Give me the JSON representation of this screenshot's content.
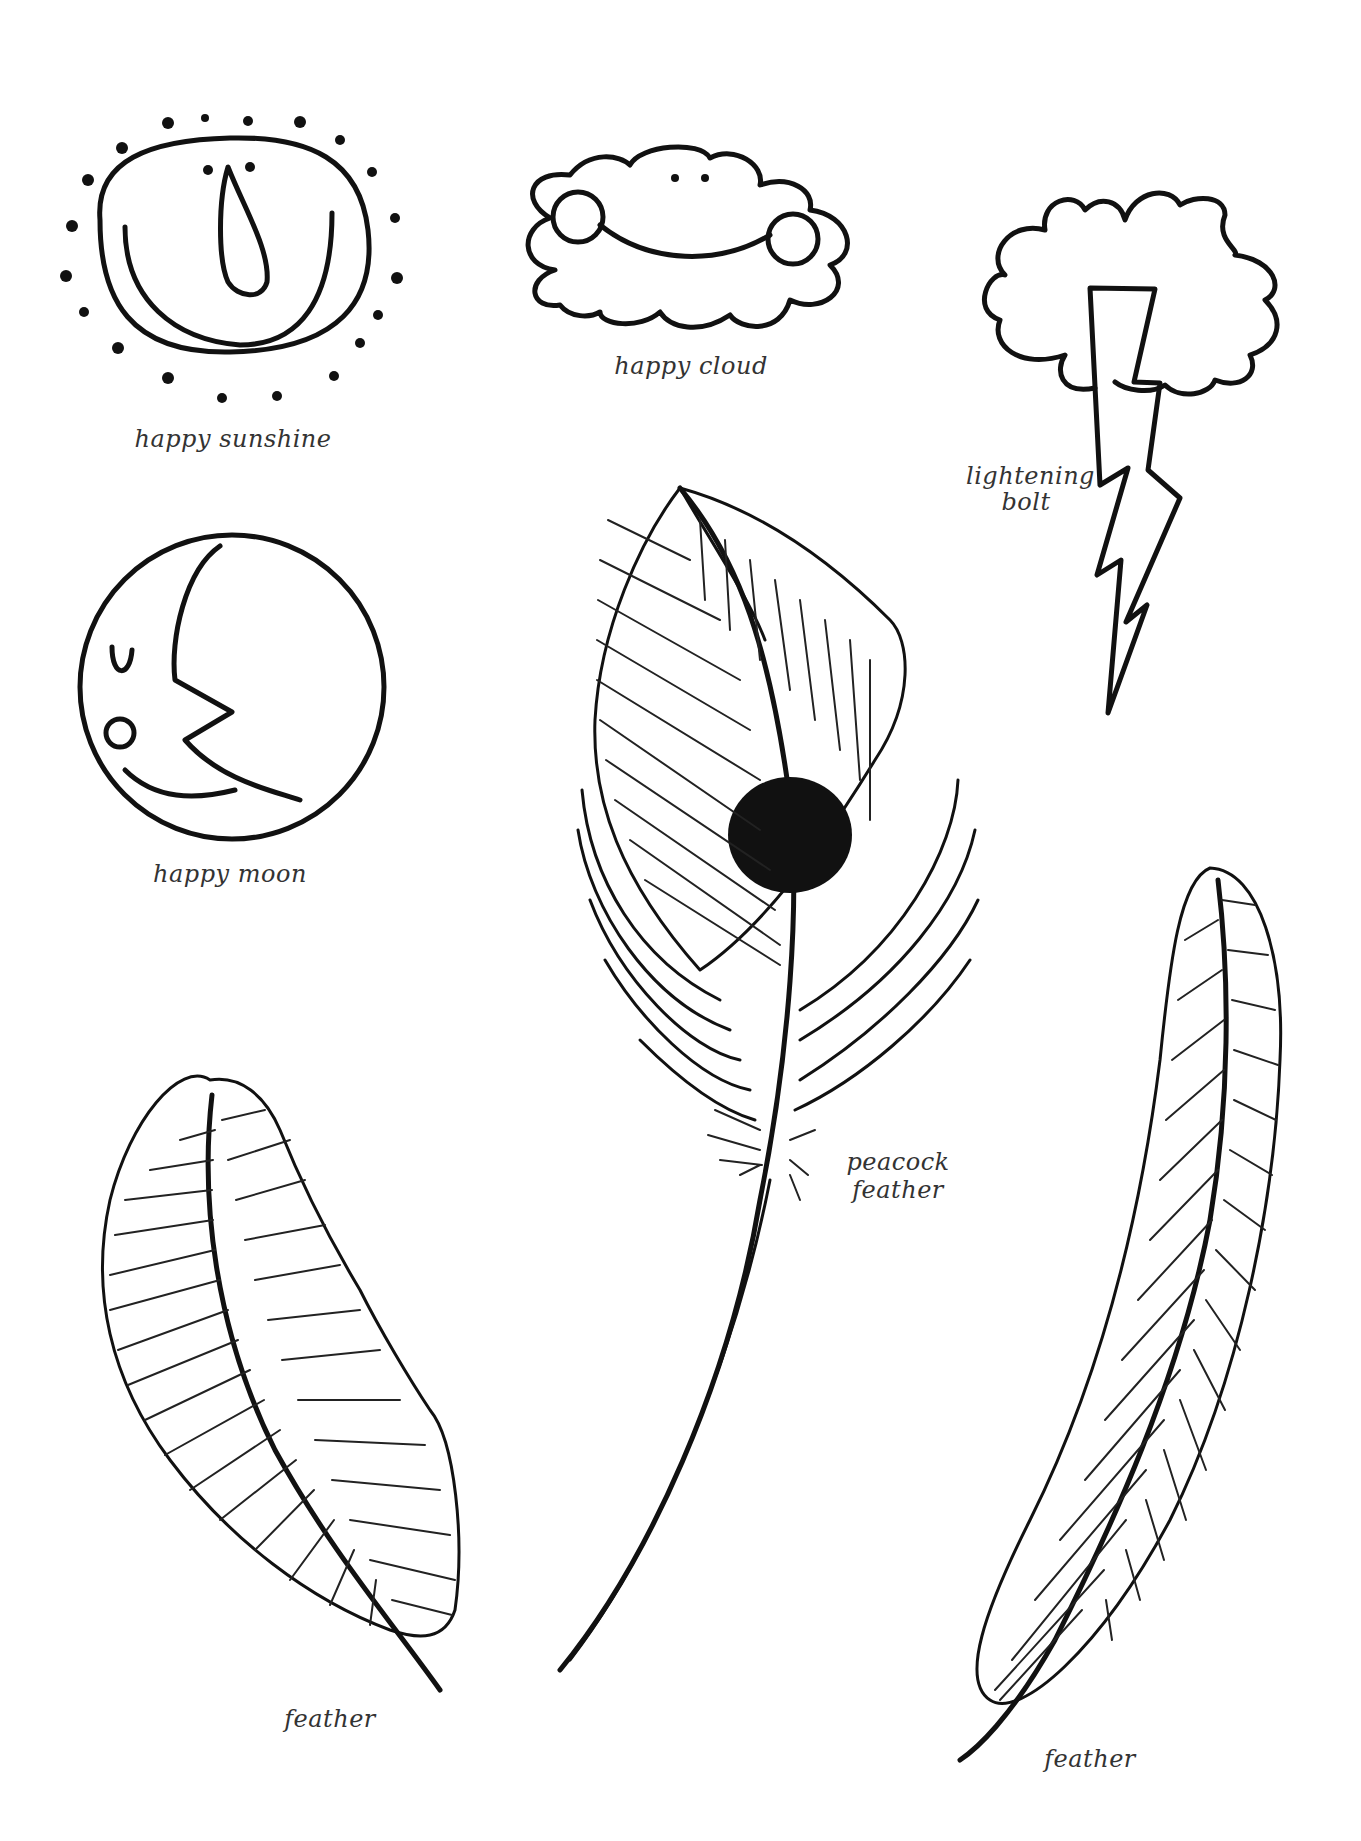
{
  "page": {
    "background": "#ffffff",
    "ink_color": "#111111",
    "label_color": "#333333"
  },
  "drawings": [
    {
      "id": "sun",
      "label": "happy sunshine"
    },
    {
      "id": "cloud",
      "label": "happy cloud"
    },
    {
      "id": "lightning",
      "label_line1": "lightening",
      "label_line2": "bolt"
    },
    {
      "id": "moon",
      "label": "happy moon"
    },
    {
      "id": "peacock",
      "label_line1": "peacock",
      "label_line2": "feather"
    },
    {
      "id": "feather-left",
      "label": "feather"
    },
    {
      "id": "feather-right",
      "label": "feather"
    }
  ]
}
